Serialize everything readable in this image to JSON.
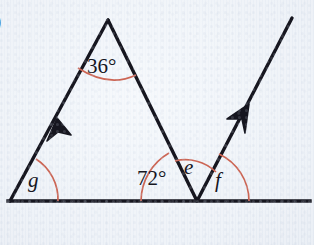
{
  "figure": {
    "part_label": ")",
    "background_color": "#eef3f8",
    "line_color": "#16161f",
    "arc_color": "#cc6655",
    "label_color": "#16161f"
  },
  "labels": {
    "apex_angle": "36°",
    "left_base_angle": "g",
    "interior_right_angle": "72°",
    "middle_angle": "e",
    "right_angle": "f"
  },
  "geometry": {
    "baseline": {
      "x1": 8,
      "y1": 201,
      "x2": 310,
      "y2": 201
    },
    "vertex_left": {
      "x": 10,
      "y": 201
    },
    "vertex_apex": {
      "x": 108,
      "y": 20
    },
    "vertex_right": {
      "x": 197,
      "y": 201
    },
    "ray_end": {
      "x": 292,
      "y": 18
    },
    "arrow_left_side": {
      "x": 57,
      "y": 120
    },
    "arrow_right_ray": {
      "x": 248,
      "y": 107
    }
  },
  "arcs": {
    "apex_arc_radius": 56,
    "left_base_arc_radius": 48,
    "interior_right_arc_radius": 56,
    "middle_arc_radius": 44,
    "right_arc_radius": 52
  }
}
